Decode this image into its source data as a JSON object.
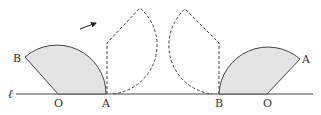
{
  "diagram": {
    "type": "geometry-rolling-sector",
    "colors": {
      "stroke": "#444444",
      "fill": "#e3e3e3",
      "text": "#333333"
    },
    "line": {
      "label": "ℓ"
    },
    "left_sector": {
      "labels": {
        "B": "B",
        "O": "O",
        "A": "A"
      }
    },
    "right_sector": {
      "labels": {
        "B": "B",
        "O": "O",
        "A": "A"
      }
    },
    "intermediate_positions": [
      {
        "name": "left-dashed-sector",
        "style": "dashed"
      },
      {
        "name": "right-dashed-sector",
        "style": "dashed"
      }
    ],
    "arrow": {
      "direction": "clockwise-right"
    }
  }
}
